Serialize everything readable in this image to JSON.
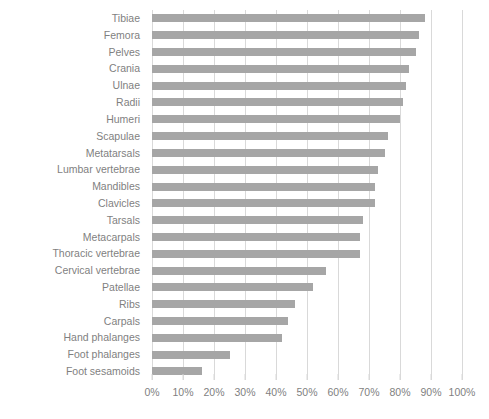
{
  "chart_data": {
    "type": "bar",
    "orientation": "horizontal",
    "title": "",
    "xlabel": "",
    "ylabel": "",
    "xlim": [
      0,
      100
    ],
    "grid": true,
    "legend": false,
    "bar_color": "#a6a6a6",
    "gridline_color": "#d9d9d9",
    "label_color": "#7f7f7f",
    "tick_labels": [
      "0%",
      "10%",
      "20%",
      "30%",
      "40%",
      "50%",
      "60%",
      "70%",
      "80%",
      "90%",
      "100%"
    ],
    "tick_values": [
      0,
      10,
      20,
      30,
      40,
      50,
      60,
      70,
      80,
      90,
      100
    ],
    "categories": [
      "Tibiae",
      "Femora",
      "Pelves",
      "Crania",
      "Ulnae",
      "Radii",
      "Humeri",
      "Scapulae",
      "Metatarsals",
      "Lumbar vertebrae",
      "Mandibles",
      "Clavicles",
      "Tarsals",
      "Metacarpals",
      "Thoracic vertebrae",
      "Cervical vertebrae",
      "Patellae",
      "Ribs",
      "Carpals",
      "Hand phalanges",
      "Foot phalanges",
      "Foot sesamoids"
    ],
    "values": [
      88,
      86,
      85,
      83,
      82,
      81,
      80,
      76,
      75,
      73,
      72,
      72,
      68,
      67,
      67,
      56,
      52,
      46,
      44,
      42,
      25,
      16
    ]
  }
}
